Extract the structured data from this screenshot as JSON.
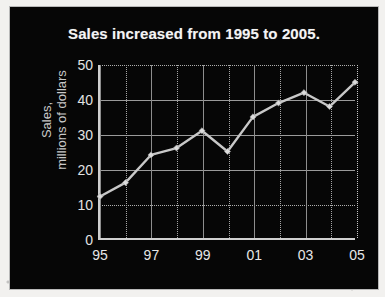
{
  "figure": {
    "background_color": "#f2f1ef",
    "plate_color": "#060606",
    "accent_color": "#c9c9c9",
    "series_color": "#c8c8c8"
  },
  "chart_data": {
    "type": "line",
    "title": "Sales increased from 1995 to 2005.",
    "xlabel": "",
    "ylabel": "Sales, millions of dollars",
    "ylabel_line1": "Sales,",
    "ylabel_line2": "millions of dollars",
    "x": [
      1995,
      1996,
      1997,
      1998,
      1999,
      2000,
      2001,
      2002,
      2003,
      2004,
      2005
    ],
    "categories": [
      "95",
      "96",
      "97",
      "98",
      "99",
      "00",
      "01",
      "02",
      "03",
      "04",
      "05"
    ],
    "values": [
      12,
      16,
      24,
      26,
      31,
      25,
      35,
      39,
      42,
      38,
      45
    ],
    "series": [
      {
        "name": "Sales",
        "values": [
          12,
          16,
          24,
          26,
          31,
          25,
          35,
          39,
          42,
          38,
          45
        ]
      }
    ],
    "ylim": [
      0,
      50
    ],
    "yticks": [
      0,
      10,
      20,
      30,
      40,
      50
    ],
    "ytick_labels": [
      "0",
      "10",
      "20",
      "30",
      "40",
      "50"
    ],
    "xlim": [
      1995,
      2005
    ],
    "xticks": [
      1995,
      1997,
      1999,
      2001,
      2003,
      2005
    ],
    "xtick_labels": [
      "95",
      "97",
      "99",
      "01",
      "03",
      "05"
    ],
    "xtick_labels_all": [
      "95",
      "",
      "97",
      "",
      "99",
      "",
      "01",
      "",
      "03",
      "",
      "05"
    ],
    "grid": true,
    "grid_style": "dotted-and-solid",
    "legend": false,
    "legend_position": "none",
    "markers": "diamond",
    "annotations": []
  }
}
